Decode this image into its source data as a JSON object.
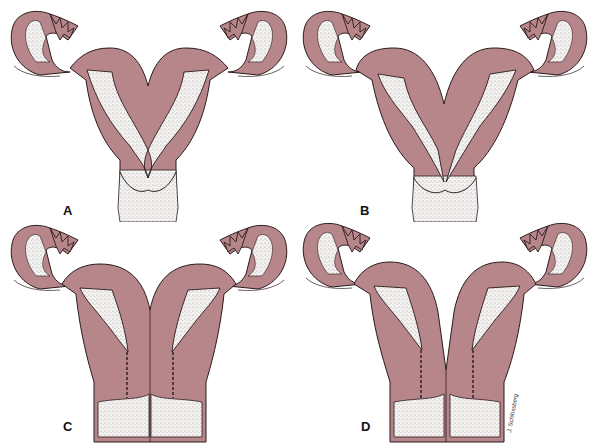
{
  "figure": {
    "panels": [
      {
        "id": "A",
        "label": "A",
        "variant": "partial-septum"
      },
      {
        "id": "B",
        "label": "B",
        "variant": "bicornuate-long"
      },
      {
        "id": "C",
        "label": "C",
        "variant": "didelphys-single-fundus"
      },
      {
        "id": "D",
        "label": "D",
        "variant": "didelphys-complete"
      }
    ],
    "signature": "J. Schlossberg",
    "colors": {
      "tissue": "#B7868A",
      "outline": "#2a1a1c",
      "cavity": "#f4f2f0",
      "background": "#ffffff"
    }
  }
}
